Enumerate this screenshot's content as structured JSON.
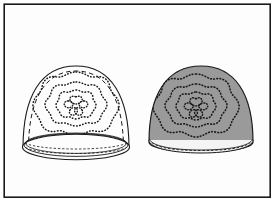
{
  "figure": {
    "kind": "patent-style-line-drawing",
    "canvas": {
      "width": 275,
      "height": 202
    },
    "background_color": "#ffffff",
    "frame": {
      "name": "figure-border",
      "stroke_color": "#1a1a1a",
      "stroke_width": 1.6,
      "fill_color": "#fdfdfd",
      "x": 4,
      "y": 4,
      "width": 266,
      "height": 193
    },
    "colors": {
      "outline": "#1a1a1a",
      "gray_fill": "#9a9a9a",
      "white_fill": "#fdfdfd",
      "band_fill": "#f2f2f2",
      "stitch": "#1a1a1a"
    },
    "objects": [
      {
        "id": "hat-left",
        "label": "left-hat-outline-white",
        "fill": "#fdfdfd",
        "outline": "#1a1a1a",
        "has_dashed_seam": true,
        "has_open_brim_ellipse": true,
        "bounds": {
          "x": 22,
          "y": 64,
          "width": 108,
          "height": 98
        },
        "crown": {
          "cx": 76,
          "cy": 146,
          "rx": 54,
          "ry": 80
        },
        "brim": {
          "cx": 76,
          "cy": 146,
          "rx": 54,
          "ry": 13
        },
        "motif": {
          "cx": 76,
          "cy": 104,
          "rings": 3,
          "petals": 5
        }
      },
      {
        "id": "hat-right",
        "label": "right-hat-gray-filled",
        "fill": "#9a9a9a",
        "outline": "#1a1a1a",
        "has_dashed_seam": false,
        "has_open_brim_ellipse": false,
        "bounds": {
          "x": 148,
          "y": 64,
          "width": 106,
          "height": 90
        },
        "crown": {
          "cx": 201,
          "cy": 140,
          "rx": 53,
          "ry": 76
        },
        "brim": {
          "cx": 201,
          "cy": 140,
          "rx": 53,
          "ry": 10
        },
        "motif": {
          "cx": 196,
          "cy": 104,
          "rings": 3,
          "petals": 5
        }
      }
    ],
    "motif_description": "concentric scalloped dotted embroidery rings with central five-petal flower",
    "captions": []
  }
}
